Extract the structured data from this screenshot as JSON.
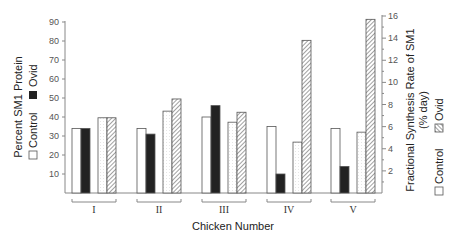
{
  "chart_data": {
    "type": "bar",
    "title": "",
    "xlabel": "Chicken Number",
    "categories": [
      "I",
      "II",
      "III",
      "IV",
      "V"
    ],
    "left_axis": {
      "label": "Percent SM1 Protein",
      "legend": [
        "Control",
        "Ovid"
      ],
      "ylim": [
        0,
        90
      ],
      "ticks": [
        10,
        20,
        30,
        40,
        50,
        60,
        70,
        80,
        90
      ]
    },
    "right_axis": {
      "label_line1": "Fractional Synthesis Rate of SM1",
      "label_line2": "(% day)",
      "legend": [
        "Control",
        "Ovid"
      ],
      "ylim": [
        0,
        16
      ],
      "ticks": [
        2,
        4,
        6,
        8,
        10,
        12,
        14,
        16
      ]
    },
    "series": [
      {
        "name": "Control (Percent SM1 Protein)",
        "axis": "left",
        "style": "white",
        "values": [
          34,
          34,
          40,
          35,
          34
        ]
      },
      {
        "name": "Ovid (Percent SM1 Protein)",
        "axis": "left",
        "style": "black",
        "values": [
          34,
          31,
          46,
          10,
          14
        ]
      },
      {
        "name": "Control (Fractional Synthesis Rate)",
        "axis": "right",
        "style": "dotted-white",
        "values": [
          6.8,
          7.4,
          6.4,
          4.6,
          5.5
        ]
      },
      {
        "name": "Ovid (Fractional Synthesis Rate)",
        "axis": "right",
        "style": "hatched",
        "values": [
          6.8,
          8.5,
          7.3,
          13.8,
          15.7
        ]
      }
    ],
    "grid": false
  }
}
